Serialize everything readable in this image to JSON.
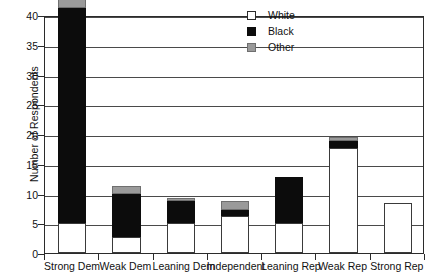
{
  "chart_data": {
    "type": "bar",
    "subtype": "stacked-vertical",
    "title": "",
    "xlabel": "",
    "ylabel": "Number of Respondents",
    "ylim": [
      0,
      40
    ],
    "ytick_step": 5,
    "yticks": [
      0,
      5,
      10,
      15,
      20,
      25,
      30,
      35,
      40
    ],
    "grid": "horizontal",
    "legend_position": "top-right",
    "categories": [
      "Strong Dem",
      "Weak Dem",
      "Leaning Dem",
      "Independent",
      "Leaning Rep",
      "Weak Rep",
      "Strong Rep"
    ],
    "series": [
      {
        "name": "White",
        "color": "#ffffff",
        "values": [
          0,
          0,
          0,
          6.3,
          0,
          17.6,
          8.4
        ]
      },
      {
        "name": "Black",
        "color": "#0c0c0c",
        "values": [
          36.2,
          7.3,
          3.7,
          0.9,
          7.8,
          1.2,
          0
        ]
      },
      {
        "name": "Other",
        "color": "#9a9a9a",
        "values": [
          2.1,
          1.3,
          0.5,
          1.6,
          0,
          0.7,
          0
        ]
      }
    ],
    "totals": [
      38.3,
      11.3,
      9.2,
      8.8,
      7.8,
      19.5,
      8.4
    ],
    "bar_bases": [
      5,
      2.7,
      5,
      0,
      5,
      0,
      0
    ]
  },
  "legend": {
    "items": [
      {
        "label": "White",
        "swatch": "white-square-icon"
      },
      {
        "label": "Black",
        "swatch": "black-square-icon"
      },
      {
        "label": "Other",
        "swatch": "gray-square-icon"
      }
    ]
  },
  "axis": {
    "y_title": "Number of Respondents",
    "y_tick_labels": [
      "40",
      "35",
      "30",
      "25",
      "20",
      "15",
      "10",
      "5",
      "0"
    ],
    "x_tick_labels": [
      "Strong Dem",
      "Weak Dem",
      "Leaning Dem",
      "Independent",
      "Leaning Rep",
      "Weak Rep",
      "Strong Rep"
    ]
  }
}
